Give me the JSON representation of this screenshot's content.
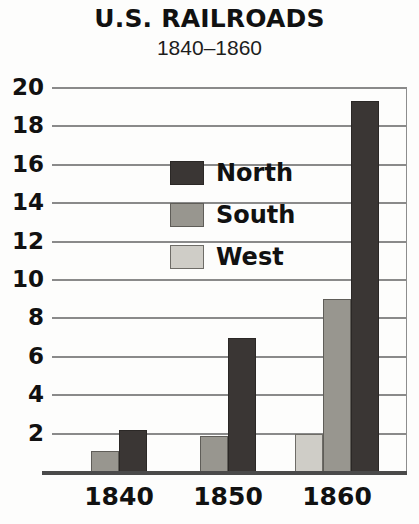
{
  "chart_data": {
    "type": "bar",
    "title": "U.S. RAILROADS",
    "subtitle": "1840–1860",
    "xlabel": "",
    "ylabel": "",
    "categories": [
      "1840",
      "1850",
      "1860"
    ],
    "series": [
      {
        "name": "West",
        "color": "#cfcdc7",
        "values": [
          null,
          null,
          2.0
        ]
      },
      {
        "name": "South",
        "color": "#98968f",
        "values": [
          1.1,
          1.9,
          9.0
        ]
      },
      {
        "name": "North",
        "color": "#3a3634",
        "values": [
          2.2,
          7.0,
          19.3
        ]
      }
    ],
    "ylim": [
      0,
      20
    ],
    "yticks": [
      2,
      4,
      6,
      8,
      10,
      12,
      14,
      16,
      18,
      20
    ],
    "ytick_labels": [
      "2",
      "4",
      "6",
      "8",
      "10",
      "12",
      "14",
      "16",
      "18",
      "20"
    ],
    "grid": true,
    "legend_position": "inside-upper-center",
    "legend": [
      {
        "label": "North",
        "color": "#3a3634"
      },
      {
        "label": "South",
        "color": "#98968f"
      },
      {
        "label": "West",
        "color": "#cfcdc7"
      }
    ]
  },
  "colors": {
    "background": "#fdfdfc",
    "text": "#111111",
    "gridline": "#8a8a8a",
    "axis": "#4a4a4a",
    "north": "#3a3634",
    "south": "#98968f",
    "west": "#cfcdc7"
  }
}
